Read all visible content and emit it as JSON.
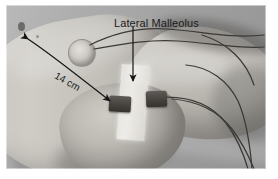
{
  "figure": {
    "type": "clinical-photograph",
    "modality": "grayscale photograph",
    "background_color": "#9a9a9a",
    "border_color": "#ffffff"
  },
  "annotations": {
    "malleolus_label": "Lateral Malleolus",
    "distance_label": "14 cm",
    "malleolus_arrow": {
      "direction": "down",
      "from": "Lateral Malleolus text",
      "to": "bony prominence on lateral ankle"
    },
    "distance_arrow": {
      "style": "double-headed curved line",
      "from": "proximal leg",
      "to": "distal sensor near lateral malleolus"
    }
  },
  "devices": [
    {
      "name": "circular-surface-electrode",
      "shape": "round",
      "color": "#cdcac4"
    },
    {
      "name": "sensor-proximal",
      "shape": "rectangular",
      "color": "#46433f"
    },
    {
      "name": "sensor-distal",
      "shape": "rectangular",
      "color": "#46433f"
    },
    {
      "name": "adhesive-tape-strip",
      "shape": "rectangular",
      "color": "#e8e6e1"
    }
  ],
  "colors": {
    "annotation_text": "#1b1b1b",
    "arrow": "#1a1a1a",
    "wire": "#3b3936",
    "skin": "#c6c3bd",
    "sheet": "#adadad"
  }
}
